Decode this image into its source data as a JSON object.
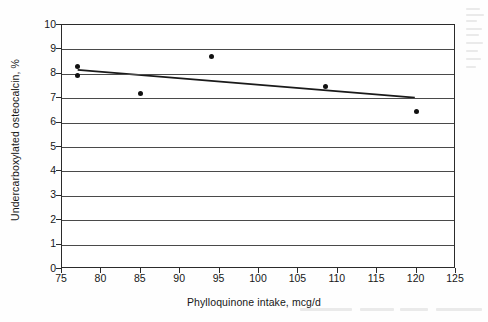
{
  "chart_data": {
    "type": "scatter",
    "title": "",
    "xlabel": "Phylloquinone intake, mcg/d",
    "ylabel": "Undercarboxylated osteocalcin, %",
    "xlim": [
      75,
      125
    ],
    "ylim": [
      0,
      10
    ],
    "xticks": [
      75,
      80,
      85,
      90,
      95,
      100,
      105,
      110,
      115,
      120,
      125
    ],
    "yticks": [
      0,
      1,
      2,
      3,
      4,
      5,
      6,
      7,
      8,
      9,
      10
    ],
    "xtick_labels": [
      "75",
      "80",
      "85",
      "90",
      "95",
      "100",
      "105",
      "110",
      "115",
      "120",
      "125"
    ],
    "ytick_labels": [
      "0",
      "1",
      "2",
      "3",
      "4",
      "5",
      "6",
      "7",
      "8",
      "9",
      "10"
    ],
    "grid": "horizontal",
    "legend": "none",
    "marker_color": "#111111",
    "line_color": "#1a1a1a",
    "points": [
      {
        "x": 77.0,
        "y": 8.3
      },
      {
        "x": 77.0,
        "y": 7.95
      },
      {
        "x": 85.0,
        "y": 7.2
      },
      {
        "x": 94.0,
        "y": 8.7
      },
      {
        "x": 108.5,
        "y": 7.5
      },
      {
        "x": 120.0,
        "y": 6.45
      }
    ],
    "series": [
      {
        "name": "Observations",
        "type": "scatter",
        "x": [
          77.0,
          77.0,
          85.0,
          94.0,
          108.5,
          120.0
        ],
        "values": [
          8.3,
          7.95,
          7.2,
          8.7,
          7.5,
          6.45
        ]
      },
      {
        "name": "Linear trend",
        "type": "line",
        "x": [
          77.0,
          120.0
        ],
        "values": [
          8.15,
          7.0
        ]
      }
    ],
    "trendline": {
      "x_start": 77.0,
      "y_start": 8.15,
      "x_end": 120.0,
      "y_end": 7.0,
      "slope": -0.0267,
      "intercept": 10.21,
      "direction": "decreasing"
    }
  }
}
